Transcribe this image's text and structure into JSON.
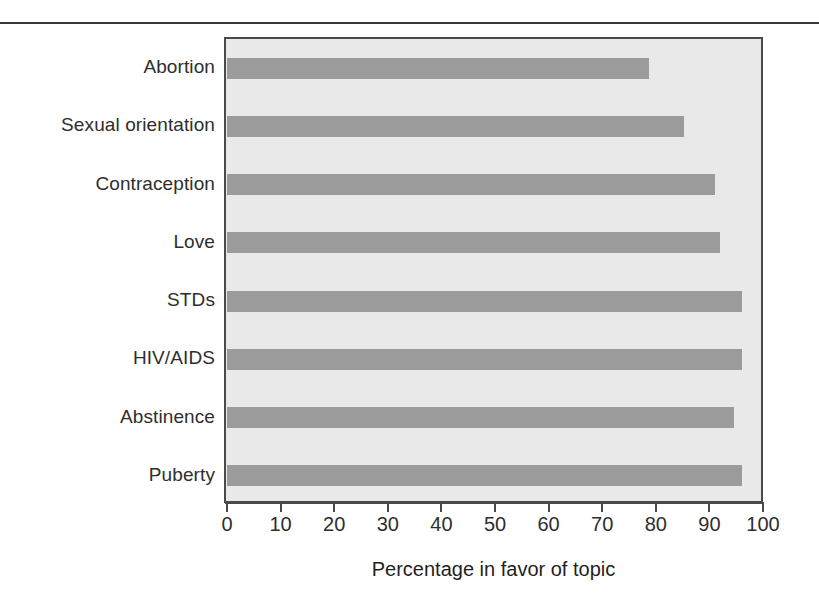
{
  "chart_data": {
    "type": "bar",
    "orientation": "horizontal",
    "title": "",
    "xlabel": "Percentage in favor of topic",
    "ylabel": "",
    "categories": [
      "Abortion",
      "Sexual orientation",
      "Contraception",
      "Love",
      "STDs",
      "HIV/AIDS",
      "Abstinence",
      "Puberty"
    ],
    "values": [
      78.7,
      85.3,
      91,
      92,
      96,
      96,
      94.5,
      96
    ],
    "xlim": [
      0,
      100
    ],
    "xticks": [
      0,
      10,
      20,
      30,
      40,
      50,
      60,
      70,
      80,
      90,
      100
    ],
    "xtick_labels": [
      "0",
      "10",
      "20",
      "30",
      "40",
      "50",
      "60",
      "70",
      "80",
      "90",
      "100"
    ],
    "grid": false,
    "legend": false,
    "bar_color": "#9b9b9b",
    "plot_background": "#e9e9e9",
    "axis_color": "#4a4a4a"
  }
}
